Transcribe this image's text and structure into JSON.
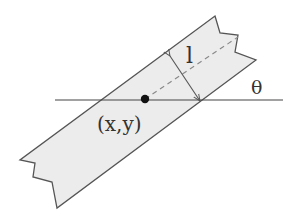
{
  "diagram": {
    "labels": {
      "center_point": "(x,y)",
      "width": "l",
      "angle": "θ"
    },
    "colors": {
      "strip_fill": "#ececec",
      "stroke": "#555555",
      "dashed_line": "#888888",
      "dot": "#111111"
    },
    "elements": [
      "infinite strip (torn ends) tilted at angle θ",
      "horizontal reference line",
      "center point (x,y)",
      "dashed centerline along strip",
      "double-headed arrow showing half-width l"
    ]
  }
}
